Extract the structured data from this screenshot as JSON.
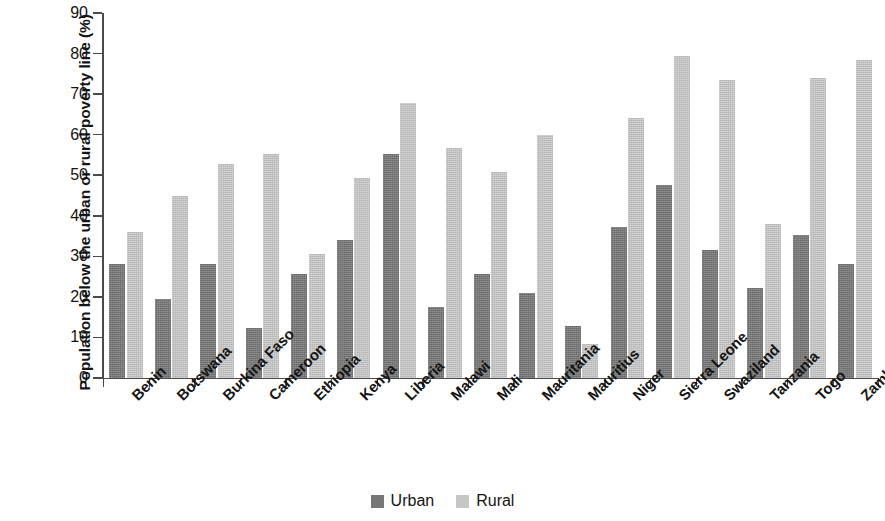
{
  "chart_data": {
    "type": "bar",
    "title": "",
    "xlabel": "",
    "ylabel": "Population below the urban or rural poverty line (%)",
    "ylim": [
      0,
      90
    ],
    "ytick_step": 10,
    "yticks": [
      0,
      10,
      20,
      30,
      40,
      50,
      60,
      70,
      80,
      90
    ],
    "grid": false,
    "legend_position": "bottom-center",
    "categories": [
      "Benin",
      "Botswana",
      "Burkina Faso",
      "Cameroon",
      "Ethiopia",
      "Kenya",
      "Liberia",
      "Malawi",
      "Mali",
      "Mauritania",
      "Mauritius",
      "Niger",
      "Sierra Leone",
      "Swaziland",
      "Tanzania",
      "Togo",
      "Zambia"
    ],
    "series": [
      {
        "name": "Urban",
        "color": "#777777",
        "values": [
          28.1,
          19.4,
          28.0,
          12.3,
          25.7,
          34.0,
          55.3,
          17.6,
          25.6,
          21.0,
          12.8,
          37.3,
          47.6,
          31.5,
          22.2,
          35.2,
          28.0
        ]
      },
      {
        "name": "Rural",
        "color": "#c6c6c6",
        "values": [
          36.0,
          44.8,
          52.8,
          55.2,
          30.6,
          49.2,
          67.7,
          56.8,
          50.8,
          60.0,
          8.3,
          64.2,
          79.3,
          73.5,
          38.0,
          74.0,
          78.5
        ]
      }
    ]
  },
  "legend": {
    "items": [
      {
        "label": "Urban",
        "swatch": "urban"
      },
      {
        "label": "Rural",
        "swatch": "rural"
      }
    ]
  }
}
